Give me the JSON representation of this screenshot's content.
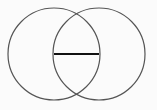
{
  "diagram": {
    "type": "two-overlapping-circles",
    "background": "#fbfbfb",
    "circle_stroke": "#555555",
    "segment_stroke": "#111111",
    "circles": [
      {
        "name": "left-circle",
        "cx": 54,
        "cy": 54,
        "r": 46
      },
      {
        "name": "right-circle",
        "cx": 99,
        "cy": 54,
        "r": 46
      }
    ],
    "segment": {
      "x1": 54,
      "y1": 54,
      "x2": 99,
      "y2": 54
    }
  }
}
